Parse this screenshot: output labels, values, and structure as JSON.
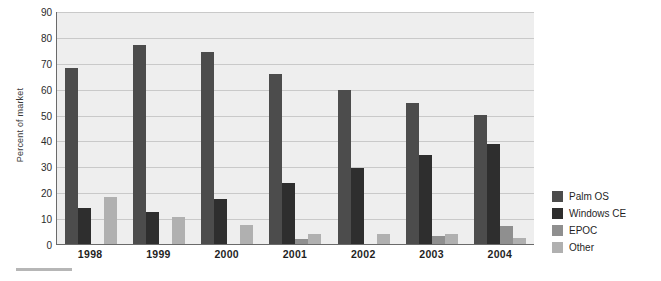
{
  "chart_data": {
    "type": "bar",
    "title": "",
    "xlabel": "",
    "ylabel": "Percent of market",
    "ylim": [
      0,
      90
    ],
    "ytick_step": 10,
    "yticks": [
      0,
      10,
      20,
      30,
      40,
      50,
      60,
      70,
      80,
      90
    ],
    "grid": true,
    "legend_position": "right",
    "categories": [
      "1998",
      "1999",
      "2000",
      "2001",
      "2002",
      "2003",
      "2004"
    ],
    "series": [
      {
        "name": "Palm OS",
        "color": "#4c4c4c",
        "values": [
          68,
          77,
          74,
          65.5,
          59.5,
          54.5,
          50
        ]
      },
      {
        "name": "Windows CE",
        "color": "#2e2e2e",
        "values": [
          14,
          12.5,
          17.5,
          23.5,
          29.5,
          34.5,
          38.5
        ]
      },
      {
        "name": "EPOC",
        "color": "#8f8f8f",
        "values": [
          0,
          0,
          0,
          2,
          0,
          3,
          7
        ]
      },
      {
        "name": "Other",
        "color": "#b0b0b0",
        "values": [
          18,
          10.5,
          7.5,
          4,
          4,
          4,
          2.5
        ]
      }
    ]
  },
  "legend": {
    "items": [
      {
        "label": "Palm OS"
      },
      {
        "label": "Windows CE"
      },
      {
        "label": "EPOC"
      },
      {
        "label": "Other"
      }
    ]
  },
  "colors": {
    "plot_background": "#eeeeee",
    "gridline": "#c9c9c9",
    "axis": "#6a6a6a",
    "rule": "#b6b6b6"
  }
}
